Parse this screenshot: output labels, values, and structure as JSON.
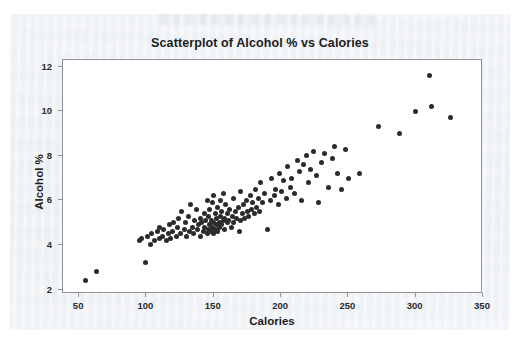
{
  "figure": {
    "title": "Scatterplot of Alcohol % vs Calories",
    "background_color": "#eef1f5",
    "plot_background_color": "#ffffff",
    "marker_color": "#2b2b2b",
    "axis_color": "#8f9399"
  },
  "chart_data": {
    "type": "scatter",
    "title": "Scatterplot of Alcohol % vs Calories",
    "xlabel": "Calories",
    "ylabel": "Alcohol %",
    "xlim": [
      38,
      350
    ],
    "ylim": [
      1.8,
      12.3
    ],
    "xticks": [
      50,
      100,
      150,
      200,
      250,
      300,
      350
    ],
    "yticks": [
      2,
      4,
      6,
      8,
      10,
      12
    ],
    "grid": false,
    "legend": null,
    "marker": "filled-circle",
    "series": [
      {
        "name": "Beers",
        "x": [
          55,
          63,
          95,
          96,
          99,
          101,
          103,
          104,
          106,
          108,
          110,
          110,
          112,
          113,
          115,
          116,
          117,
          118,
          119,
          120,
          122,
          123,
          124,
          125,
          126,
          128,
          129,
          130,
          131,
          132,
          133,
          134,
          135,
          136,
          137,
          138,
          139,
          140,
          140,
          141,
          142,
          143,
          143,
          144,
          145,
          145,
          146,
          146,
          147,
          147,
          148,
          148,
          149,
          149,
          150,
          150,
          150,
          151,
          151,
          152,
          152,
          153,
          153,
          154,
          154,
          155,
          155,
          156,
          156,
          157,
          157,
          158,
          158,
          159,
          160,
          160,
          161,
          162,
          163,
          164,
          165,
          165,
          166,
          167,
          168,
          169,
          170,
          170,
          171,
          172,
          173,
          174,
          175,
          176,
          177,
          178,
          179,
          180,
          181,
          182,
          183,
          184,
          185,
          186,
          188,
          190,
          192,
          193,
          195,
          196,
          198,
          199,
          200,
          202,
          204,
          205,
          207,
          208,
          210,
          212,
          214,
          215,
          217,
          219,
          220,
          222,
          224,
          226,
          228,
          230,
          232,
          235,
          238,
          240,
          242,
          245,
          248,
          250,
          258,
          272,
          288,
          300,
          310,
          312,
          326
        ],
        "y": [
          2.4,
          2.8,
          4.2,
          4.3,
          3.2,
          4.4,
          4.0,
          4.5,
          4.2,
          4.6,
          4.3,
          4.8,
          4.4,
          4.7,
          4.2,
          4.5,
          4.9,
          4.3,
          4.6,
          5.0,
          4.4,
          4.8,
          5.2,
          4.5,
          5.5,
          4.7,
          5.0,
          4.4,
          5.3,
          4.6,
          5.8,
          4.8,
          4.5,
          5.1,
          5.6,
          4.7,
          4.9,
          5.2,
          4.4,
          5.0,
          4.6,
          5.4,
          4.8,
          5.1,
          4.5,
          6.0,
          4.7,
          5.3,
          4.9,
          5.6,
          4.6,
          5.1,
          4.8,
          5.9,
          4.5,
          5.0,
          6.2,
          4.7,
          5.4,
          4.9,
          5.2,
          4.6,
          5.7,
          5.0,
          4.8,
          5.3,
          6.0,
          4.9,
          5.5,
          5.1,
          6.3,
          4.7,
          5.2,
          5.8,
          5.0,
          5.4,
          5.1,
          5.6,
          4.8,
          5.3,
          5.0,
          6.1,
          5.5,
          5.2,
          5.7,
          4.6,
          5.1,
          6.4,
          5.4,
          5.8,
          5.2,
          6.0,
          5.5,
          5.3,
          6.2,
          5.6,
          5.9,
          5.4,
          6.5,
          5.7,
          6.1,
          5.5,
          6.8,
          5.9,
          6.3,
          4.7,
          6.0,
          7.0,
          6.2,
          6.5,
          5.8,
          7.2,
          6.4,
          6.9,
          6.1,
          7.5,
          6.6,
          7.0,
          6.3,
          7.8,
          7.3,
          6.0,
          7.6,
          8.0,
          6.8,
          7.4,
          8.2,
          7.1,
          5.9,
          7.7,
          8.1,
          6.6,
          7.9,
          8.4,
          7.2,
          6.5,
          8.3,
          7.0,
          7.2,
          9.3,
          9.0,
          10.0,
          11.6,
          10.2,
          9.7
        ]
      }
    ]
  }
}
